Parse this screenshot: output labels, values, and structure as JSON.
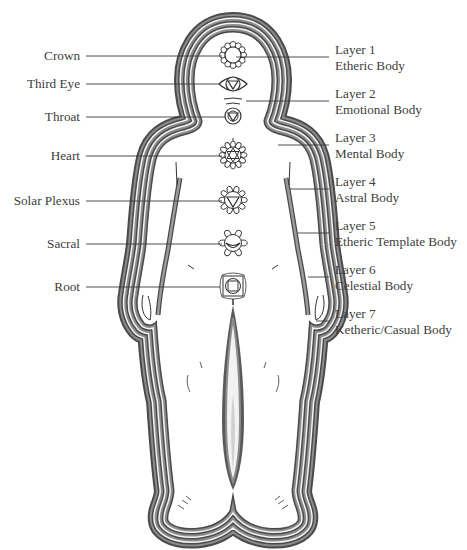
{
  "chakras": [
    {
      "id": "crown",
      "label": "Crown"
    },
    {
      "id": "third-eye",
      "label": "Third Eye"
    },
    {
      "id": "throat",
      "label": "Throat"
    },
    {
      "id": "heart",
      "label": "Heart"
    },
    {
      "id": "solar-plexus",
      "label": "Solar Plexus"
    },
    {
      "id": "sacral",
      "label": "Sacral"
    },
    {
      "id": "root",
      "label": "Root"
    }
  ],
  "layers": [
    {
      "id": "layer-1",
      "number": "Layer 1",
      "name": "Etheric Body"
    },
    {
      "id": "layer-2",
      "number": "Layer 2",
      "name": "Emotional Body"
    },
    {
      "id": "layer-3",
      "number": "Layer 3",
      "name": "Mental Body"
    },
    {
      "id": "layer-4",
      "number": "Layer 4",
      "name": "Astral Body"
    },
    {
      "id": "layer-5",
      "number": "Layer 5",
      "name": "Etheric Template Body"
    },
    {
      "id": "layer-6",
      "number": "Layer 6",
      "name": "Celestial Body"
    },
    {
      "id": "layer-7",
      "number": "Layer 7",
      "name": "Ketheric/Casual Body"
    }
  ],
  "colors": {
    "aura_dark": "#4a4a4a",
    "aura_mid": "#8c8c8c",
    "aura_light": "#f4f4f4",
    "line": "#3a3a3a"
  }
}
